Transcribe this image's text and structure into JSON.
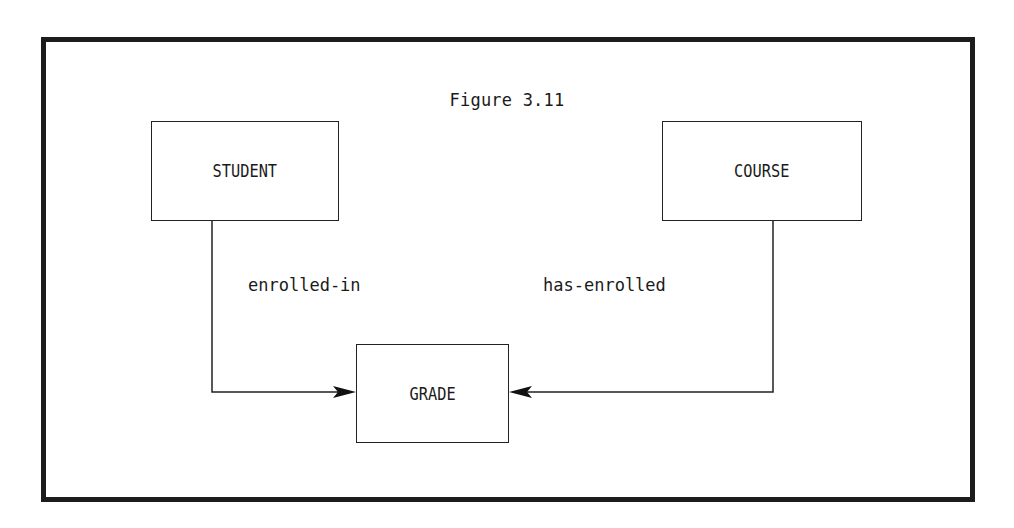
{
  "figure": {
    "title": "Figure 3.11"
  },
  "entities": [
    {
      "id": "student",
      "label": "STUDENT"
    },
    {
      "id": "course",
      "label": "COURSE"
    },
    {
      "id": "grade",
      "label": "GRADE"
    }
  ],
  "relationships": [
    {
      "from": "STUDENT",
      "to": "GRADE",
      "label": "enrolled-in"
    },
    {
      "from": "COURSE",
      "to": "GRADE",
      "label": "has-enrolled"
    }
  ],
  "colors": {
    "stroke": "#1c1c1c",
    "background": "#ffffff"
  }
}
